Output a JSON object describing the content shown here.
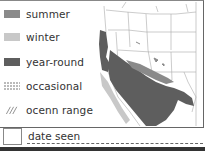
{
  "legend": {
    "items": [
      {
        "label": "summer",
        "color": "#8a8a8a",
        "style": "solid"
      },
      {
        "label": "winter",
        "color": "#c8c8c8",
        "style": "solid"
      },
      {
        "label": "year-round",
        "color": "#5e5e5e",
        "style": "solid"
      },
      {
        "label": "occasional",
        "color": "#777777",
        "style": "dotted"
      },
      {
        "label": "ocenn range",
        "color": "#777777",
        "style": "hatched"
      }
    ]
  },
  "footer": {
    "date_label": "date seen"
  },
  "colors": {
    "year_round": "#5e5e5e",
    "summer": "#8a8a8a",
    "winter": "#c8c8c8",
    "state_lines": "#999999"
  }
}
